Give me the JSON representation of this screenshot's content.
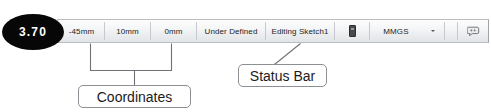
{
  "badge": {
    "label": "3.70",
    "color": "#070707",
    "text_color": "#ffffff"
  },
  "status_bar": {
    "name": "status-bar",
    "coordinates": [
      {
        "name": "x-coordinate",
        "value": "-45mm"
      },
      {
        "name": "y-coordinate",
        "value": "10mm"
      },
      {
        "name": "z-coordinate",
        "value": "0mm"
      }
    ],
    "sketch_state": "Under Defined",
    "editing_context": "Editing Sketch1",
    "toggle_icon": "rectangle-toggle-icon",
    "units": "MMGS",
    "units_caret": "chevron-down-icon",
    "tail_icon": "annotation-tag-icon",
    "separator_color": "#c6c9cd",
    "border_color": "#b9bcc0"
  },
  "callouts": [
    {
      "name": "callout-coordinates",
      "label": "Coordinates",
      "connector": "bracket"
    },
    {
      "name": "callout-status-bar",
      "label": "Status Bar",
      "connector": "leader-line"
    }
  ],
  "annotation": {
    "line_color": "#6e7176"
  }
}
